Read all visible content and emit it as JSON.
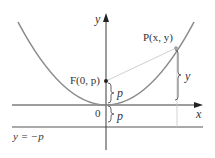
{
  "diagram": {
    "type": "parabola-focus-directrix",
    "colors": {
      "curve": "#8a8a8a",
      "axis": "#3a3a3a",
      "directrix": "#555555",
      "segment": "#d0d0d0",
      "brace": "#555555",
      "guide": "#c8c8c8",
      "point": "#222222",
      "text": "#333333"
    },
    "labels": {
      "y_axis": "y",
      "x_axis": "x",
      "origin": "0",
      "focus": "F(0, p)",
      "point": "P(x, y)",
      "brace_focus": "p",
      "brace_directrix": "p",
      "brace_point": "y",
      "directrix": "y = −p"
    }
  }
}
